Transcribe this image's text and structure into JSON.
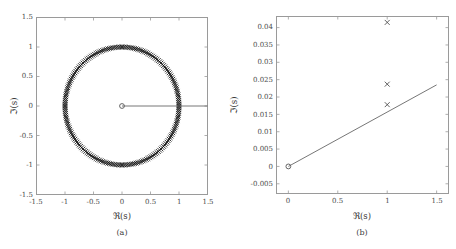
{
  "figure": {
    "panels": [
      {
        "id": "a",
        "caption": "(a)",
        "xlabel": "ℜ(s)",
        "ylabel": "ℑ(s)"
      },
      {
        "id": "b",
        "caption": "(b)",
        "xlabel": "ℜ(s)",
        "ylabel": "ℑ(s)"
      }
    ]
  },
  "chart_data": [
    {
      "type": "scatter",
      "panel": "a",
      "title": "",
      "xlabel": "ℜ(s)",
      "ylabel": "ℑ(s)",
      "xlim": [
        -1.5,
        1.5
      ],
      "ylim": [
        -1.5,
        1.5
      ],
      "xticks": [
        -1.5,
        -1,
        -0.5,
        0,
        0.5,
        1,
        1.5
      ],
      "xticklabels": [
        "-1.5",
        "-1",
        "-0.5",
        "0",
        "0.5",
        "1",
        "1.5"
      ],
      "yticks": [
        -1.5,
        -1,
        -0.5,
        0,
        0.5,
        1,
        1.5
      ],
      "yticklabels": [
        "-1.5",
        "-1",
        "-0.5",
        "0",
        "0.5",
        "1",
        "1.5"
      ],
      "grid": false,
      "legend": null,
      "series": [
        {
          "name": "eigenvalues-unit-circle",
          "marker": "x",
          "color": "#111111",
          "description": "dense ring of x markers on the unit circle |s| = 1",
          "shape": "circle",
          "center": [
            0,
            0
          ],
          "radius": 1,
          "n_points": 200
        },
        {
          "name": "origin-pole",
          "marker": "o",
          "color": "#555555",
          "points": [
            [
              0,
              0
            ]
          ]
        },
        {
          "name": "branch-cut-line",
          "marker": "line",
          "color": "#666666",
          "points": [
            [
              0,
              0
            ],
            [
              1.5,
              0
            ]
          ]
        }
      ]
    },
    {
      "type": "scatter",
      "panel": "b",
      "title": "",
      "xlabel": "ℜ(s)",
      "ylabel": "ℑ(s)",
      "xlim": [
        -0.12,
        1.62
      ],
      "ylim": [
        -0.0078,
        0.0432
      ],
      "xticks": [
        0,
        0.5,
        1,
        1.5
      ],
      "xticklabels": [
        "0",
        "0.5",
        "1",
        "1.5"
      ],
      "yticks": [
        -0.005,
        0,
        0.005,
        0.01,
        0.015,
        0.02,
        0.025,
        0.03,
        0.035,
        0.04
      ],
      "yticklabels": [
        "-0.005",
        "0",
        "0.005",
        "0.01",
        "0.015",
        "0.02",
        "0.025",
        "0.03",
        "0.035",
        "0.04"
      ],
      "grid": false,
      "legend": null,
      "series": [
        {
          "name": "eigenvalue-markers",
          "marker": "x",
          "color": "#444444",
          "points": [
            [
              1,
              0.0415
            ],
            [
              1,
              0.0237
            ],
            [
              1,
              0.0178
            ]
          ]
        },
        {
          "name": "origin-pole",
          "marker": "o",
          "color": "#555555",
          "points": [
            [
              0,
              0
            ]
          ]
        },
        {
          "name": "branch-cut-line",
          "marker": "line",
          "color": "#666666",
          "points": [
            [
              0,
              0
            ],
            [
              1.5,
              0.0235
            ]
          ]
        }
      ]
    }
  ]
}
